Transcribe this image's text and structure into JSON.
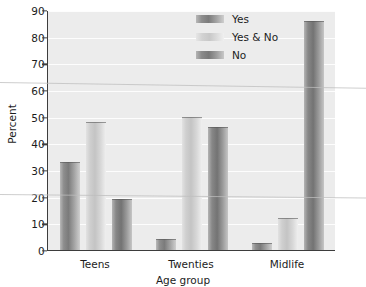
{
  "chart_data": {
    "type": "bar",
    "title": "",
    "xlabel": "Age group",
    "ylabel": "Percent",
    "categories": [
      "Teens",
      "Twenties",
      "Midlife"
    ],
    "series": [
      {
        "name": "Yes",
        "values": [
          33,
          4,
          2.5
        ]
      },
      {
        "name": "Yes & No",
        "values": [
          48,
          50,
          12
        ]
      },
      {
        "name": "No",
        "values": [
          19,
          46,
          86
        ]
      }
    ],
    "ylim": [
      0,
      90
    ],
    "yticks": [
      0,
      10,
      20,
      30,
      40,
      50,
      60,
      70,
      80,
      90
    ],
    "ytick_labels": [
      "0",
      "10",
      "20",
      "30",
      "40",
      "50",
      "60",
      "70",
      "80",
      "90"
    ],
    "grid": true,
    "legend_position": "top-right",
    "colors": {
      "series_yes": "#7b7b7b",
      "series_yes_and_no": "#c8c8c8",
      "series_no": "#737373",
      "plot_background": "#ececec",
      "axis": "#3d3d3d",
      "gridline": "#fdfdfd"
    }
  },
  "legend": {
    "items": [
      {
        "label": "Yes"
      },
      {
        "label": "Yes & No"
      },
      {
        "label": "No"
      }
    ]
  }
}
